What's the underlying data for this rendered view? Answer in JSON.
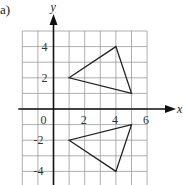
{
  "part_label": "a)",
  "axes": {
    "x_label": "x",
    "y_label": "y",
    "x_tick_labels": [
      "0",
      "2",
      "4",
      "6"
    ],
    "y_tick_labels_positive": [
      "4",
      "2"
    ],
    "y_tick_labels_negative": [
      "-2",
      "-4"
    ]
  },
  "grid": {
    "x_min": -2,
    "x_max": 6,
    "y_min": -5,
    "y_max": 5,
    "origin_px": [
      53.5,
      109
    ],
    "unit_px": 15.6,
    "grid_color": "#9a9a9a",
    "axis_color": "#111111",
    "shape_color": "#222222"
  },
  "shapes": [
    {
      "name": "triangle-upper",
      "vertices": [
        [
          1,
          2
        ],
        [
          4,
          4
        ],
        [
          5,
          1
        ]
      ]
    },
    {
      "name": "triangle-lower",
      "vertices": [
        [
          1,
          -2
        ],
        [
          4,
          -4
        ],
        [
          5,
          -1
        ]
      ]
    }
  ]
}
